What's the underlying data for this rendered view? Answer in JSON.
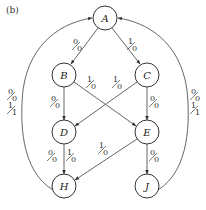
{
  "caption": "(b)",
  "nodes": {
    "A": {
      "label": "A"
    },
    "B": {
      "label": "B"
    },
    "C": {
      "label": "C"
    },
    "D": {
      "label": "D"
    },
    "E": {
      "label": "E"
    },
    "H": {
      "label": "H"
    },
    "J": {
      "label": "J"
    }
  },
  "edges": {
    "A_B": {
      "from": "A",
      "to": "B",
      "labels": [
        {
          "in": "0",
          "out": "0"
        }
      ]
    },
    "A_C": {
      "from": "A",
      "to": "C",
      "labels": [
        {
          "in": "1",
          "out": "0"
        }
      ]
    },
    "B_D": {
      "from": "B",
      "to": "D",
      "labels": [
        {
          "in": "0",
          "out": "0"
        }
      ]
    },
    "B_E": {
      "from": "B",
      "to": "E",
      "labels": [
        {
          "in": "1",
          "out": "0"
        }
      ]
    },
    "C_D": {
      "from": "C",
      "to": "D",
      "labels": [
        {
          "in": "1",
          "out": "0"
        }
      ]
    },
    "C_E": {
      "from": "C",
      "to": "E",
      "labels": [
        {
          "in": "0",
          "out": "0"
        }
      ]
    },
    "D_H": {
      "from": "D",
      "to": "H",
      "labels": [
        {
          "in": "0",
          "out": "0"
        },
        {
          "in": "1",
          "out": "0"
        }
      ]
    },
    "E_H": {
      "from": "E",
      "to": "H",
      "labels": [
        {
          "in": "1",
          "out": "0"
        }
      ]
    },
    "E_J": {
      "from": "E",
      "to": "J",
      "labels": [
        {
          "in": "0",
          "out": "0"
        }
      ]
    },
    "H_A": {
      "from": "H",
      "to": "A",
      "labels": [
        {
          "in": "0",
          "out": "0"
        },
        {
          "in": "1",
          "out": "1"
        }
      ]
    },
    "J_A": {
      "from": "J",
      "to": "A",
      "labels": [
        {
          "in": "0",
          "out": "0"
        },
        {
          "in": "1",
          "out": "1"
        }
      ]
    }
  }
}
